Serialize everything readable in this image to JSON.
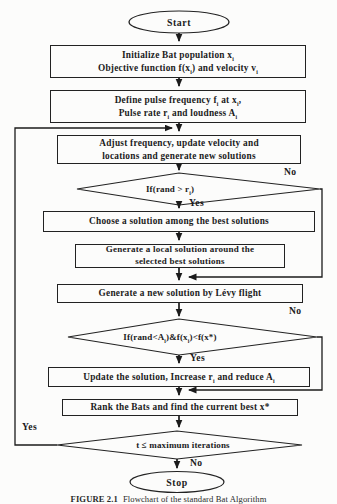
{
  "palette": {
    "ink": "#222222",
    "background": "#fcfcfb"
  },
  "flowchart": {
    "terminals": {
      "start": "Start",
      "stop": "Stop"
    },
    "steps": {
      "init": {
        "line1": "Initialize Bat population x<sub>i</sub>",
        "line2": "Objective function f(x<sub>i</sub>) and velocity v<sub>i</sub>"
      },
      "define": {
        "line1": "Define pulse frequency f<sub>i</sub> at x<sub>i</sub>,",
        "line2": "Pulse rate r<sub>i</sub> and loudness A<sub>i</sub>"
      },
      "adjust": {
        "line1": "Adjust frequency, update velocity and",
        "line2": "locations and generate new solutions"
      },
      "choose": {
        "line1": "Choose a solution among the best solutions"
      },
      "local": {
        "line1": "Generate a local solution around the",
        "line2": "selected best solutions"
      },
      "levy": {
        "line1": "Generate a new solution by Lévy flight"
      },
      "update": {
        "line1": "Update the solution, Increase r<sub>i</sub> and reduce A<sub>i</sub>"
      },
      "rank": {
        "line1": "Rank the Bats and find the current best x*"
      }
    },
    "decisions": {
      "pulse": "If(rand &gt; r<sub>i</sub>)",
      "accept": "If(rand&lt;A<sub>i</sub>)&amp;f(x<sub>i</sub>)&lt;f(x*)",
      "loop": "t ≤ maximum iterations"
    },
    "branch_labels": {
      "yes": "Yes",
      "no": "No"
    }
  },
  "caption": {
    "prefix": "FIGURE 2.1",
    "text": "Flowchart of the standard Bat Algorithm"
  }
}
